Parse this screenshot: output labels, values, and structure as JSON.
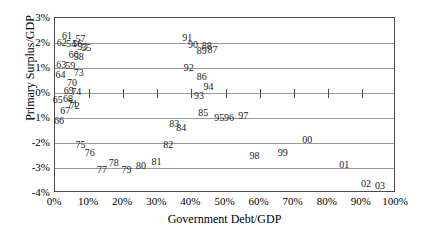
{
  "chart_data": {
    "type": "scatter",
    "title": "",
    "xlabel": "Government Debt/GDP",
    "ylabel": "Primary Surplus/GDP",
    "xlim": [
      0,
      100
    ],
    "ylim": [
      -4,
      3
    ],
    "grid": true,
    "legend": false,
    "point_label_style": "two-digit-year",
    "xticks": [
      "0%",
      "10%",
      "20%",
      "30%",
      "40%",
      "50%",
      "60%",
      "70%",
      "80%",
      "90%",
      "100%"
    ],
    "yticks": [
      "3%",
      "2%",
      "1%",
      "0%",
      "-1%",
      "-2%",
      "-3%",
      "-4%"
    ],
    "points": [
      {
        "label": "61",
        "x": 3.5,
        "y": 2.28
      },
      {
        "label": "57",
        "x": 7.5,
        "y": 2.18
      },
      {
        "label": "62",
        "x": 2.0,
        "y": 2.0
      },
      {
        "label": "54",
        "x": 4.8,
        "y": 1.98
      },
      {
        "label": "56",
        "x": 6.5,
        "y": 1.96
      },
      {
        "label": "53",
        "x": 8.0,
        "y": 1.86
      },
      {
        "label": "55",
        "x": 9.2,
        "y": 1.8
      },
      {
        "label": "60",
        "x": 5.5,
        "y": 1.52
      },
      {
        "label": "58",
        "x": 7.0,
        "y": 1.46
      },
      {
        "label": "63",
        "x": 1.8,
        "y": 1.12
      },
      {
        "label": "59",
        "x": 4.5,
        "y": 1.1
      },
      {
        "label": "64",
        "x": 1.6,
        "y": 0.72
      },
      {
        "label": "73",
        "x": 7.0,
        "y": 0.82
      },
      {
        "label": "70",
        "x": 5.0,
        "y": 0.42
      },
      {
        "label": "69",
        "x": 4.0,
        "y": 0.08
      },
      {
        "label": "74",
        "x": 6.2,
        "y": 0.06
      },
      {
        "label": "65",
        "x": 0.8,
        "y": -0.28
      },
      {
        "label": "68",
        "x": 3.8,
        "y": -0.24
      },
      {
        "label": "71",
        "x": 5.2,
        "y": -0.44
      },
      {
        "label": "72",
        "x": 5.8,
        "y": -0.5
      },
      {
        "label": "67",
        "x": 3.0,
        "y": -0.7
      },
      {
        "label": "66",
        "x": 1.2,
        "y": -1.1
      },
      {
        "label": "75",
        "x": 7.5,
        "y": -2.08
      },
      {
        "label": "76",
        "x": 10.2,
        "y": -2.4
      },
      {
        "label": "77",
        "x": 13.8,
        "y": -3.08
      },
      {
        "label": "78",
        "x": 17.2,
        "y": -2.8
      },
      {
        "label": "79",
        "x": 21.0,
        "y": -3.08
      },
      {
        "label": "80",
        "x": 25.2,
        "y": -2.92
      },
      {
        "label": "81",
        "x": 29.8,
        "y": -2.76
      },
      {
        "label": "82",
        "x": 33.2,
        "y": -2.08
      },
      {
        "label": "83",
        "x": 35.0,
        "y": -1.22
      },
      {
        "label": "84",
        "x": 37.0,
        "y": -1.38
      },
      {
        "label": "85",
        "x": 43.5,
        "y": -0.8
      },
      {
        "label": "86",
        "x": 43.0,
        "y": 0.64
      },
      {
        "label": "87",
        "x": 46.2,
        "y": 1.72
      },
      {
        "label": "88",
        "x": 44.5,
        "y": 1.88
      },
      {
        "label": "89",
        "x": 43.0,
        "y": 1.7
      },
      {
        "label": "90",
        "x": 40.5,
        "y": 1.92
      },
      {
        "label": "91",
        "x": 38.8,
        "y": 2.2
      },
      {
        "label": "92",
        "x": 39.2,
        "y": 1.0
      },
      {
        "label": "93",
        "x": 42.2,
        "y": -0.12
      },
      {
        "label": "94",
        "x": 45.0,
        "y": 0.26
      },
      {
        "label": "95",
        "x": 48.2,
        "y": -1.0
      },
      {
        "label": "96",
        "x": 51.0,
        "y": -1.0
      },
      {
        "label": "97",
        "x": 55.2,
        "y": -0.92
      },
      {
        "label": "98",
        "x": 58.5,
        "y": -2.52
      },
      {
        "label": "99",
        "x": 66.8,
        "y": -2.4
      },
      {
        "label": "00",
        "x": 74.0,
        "y": -1.88
      },
      {
        "label": "01",
        "x": 84.8,
        "y": -2.88
      },
      {
        "label": "02",
        "x": 91.2,
        "y": -3.64
      },
      {
        "label": "03",
        "x": 95.3,
        "y": -3.72
      }
    ]
  }
}
